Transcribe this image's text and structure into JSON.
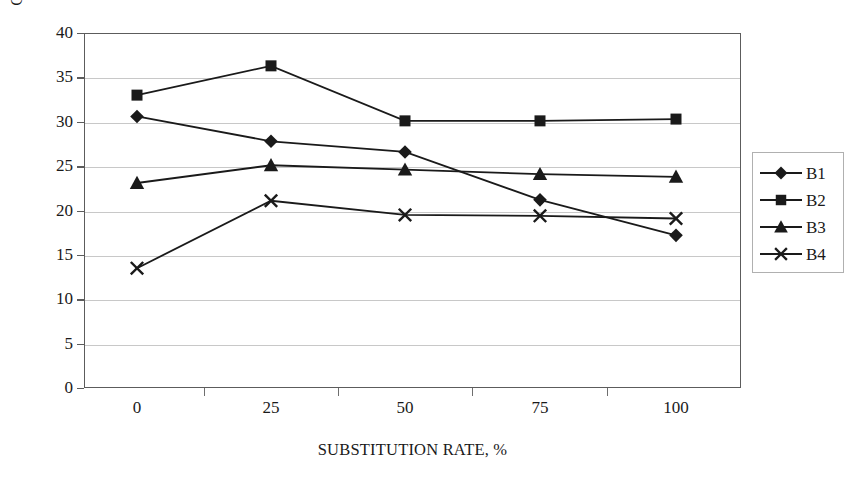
{
  "chart_data": {
    "type": "line",
    "title": "",
    "xlabel": "SUBSTITUTION RATE, %",
    "ylabel": "COMPRESSIVE STRENGTH, MPa",
    "x": [
      0,
      25,
      50,
      75,
      100
    ],
    "categories": [
      "0",
      "25",
      "50",
      "75",
      "100"
    ],
    "xlim": [
      0,
      100
    ],
    "ylim": [
      0,
      40
    ],
    "yticks": [
      0,
      5,
      10,
      15,
      20,
      25,
      30,
      35,
      40
    ],
    "ytick_labels": [
      "0",
      "5",
      "10",
      "15",
      "20",
      "25",
      "30",
      "35",
      "40"
    ],
    "xtick_labels": [
      "0",
      "25",
      "50",
      "75",
      "100"
    ],
    "grid": "horizontal",
    "legend_position": "right",
    "series": [
      {
        "name": "B1",
        "marker": "diamond",
        "color": "#1a1a1a",
        "values": [
          30.6,
          27.8,
          26.6,
          21.2,
          17.2
        ]
      },
      {
        "name": "B2",
        "marker": "square",
        "color": "#1a1a1a",
        "values": [
          33.0,
          36.3,
          30.1,
          30.1,
          30.3
        ]
      },
      {
        "name": "B3",
        "marker": "triangle",
        "color": "#1a1a1a",
        "values": [
          23.1,
          25.1,
          24.6,
          24.1,
          23.8
        ]
      },
      {
        "name": "B4",
        "marker": "x",
        "color": "#1a1a1a",
        "values": [
          13.5,
          21.1,
          19.5,
          19.4,
          19.1
        ]
      }
    ]
  },
  "legend": {
    "entries": [
      {
        "label": "B1",
        "marker": "diamond"
      },
      {
        "label": "B2",
        "marker": "square"
      },
      {
        "label": "B3",
        "marker": "triangle"
      },
      {
        "label": "B4",
        "marker": "x"
      }
    ]
  }
}
